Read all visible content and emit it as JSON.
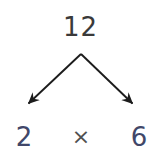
{
  "diagram": {
    "type": "factor-tree",
    "title": "",
    "background_color": "#ffffff",
    "root": {
      "label": "12",
      "value": 12,
      "color": "#3a3a3a"
    },
    "operator": {
      "label": "×",
      "name": "multiplication-sign",
      "color": "#505050"
    },
    "leaves": [
      {
        "label": "2",
        "value": 2,
        "color": "#414769",
        "position": "left"
      },
      {
        "label": "6",
        "value": 6,
        "color": "#414769",
        "position": "right"
      }
    ],
    "branches": [
      {
        "name": "branch-left",
        "from": [
          81,
          54
        ],
        "to": [
          24,
          108
        ],
        "color": "#1c1c1c",
        "arrowhead": true
      },
      {
        "name": "branch-right",
        "from": [
          81,
          54
        ],
        "to": [
          137,
          108
        ],
        "color": "#1c1c1c",
        "arrowhead": true
      }
    ]
  }
}
